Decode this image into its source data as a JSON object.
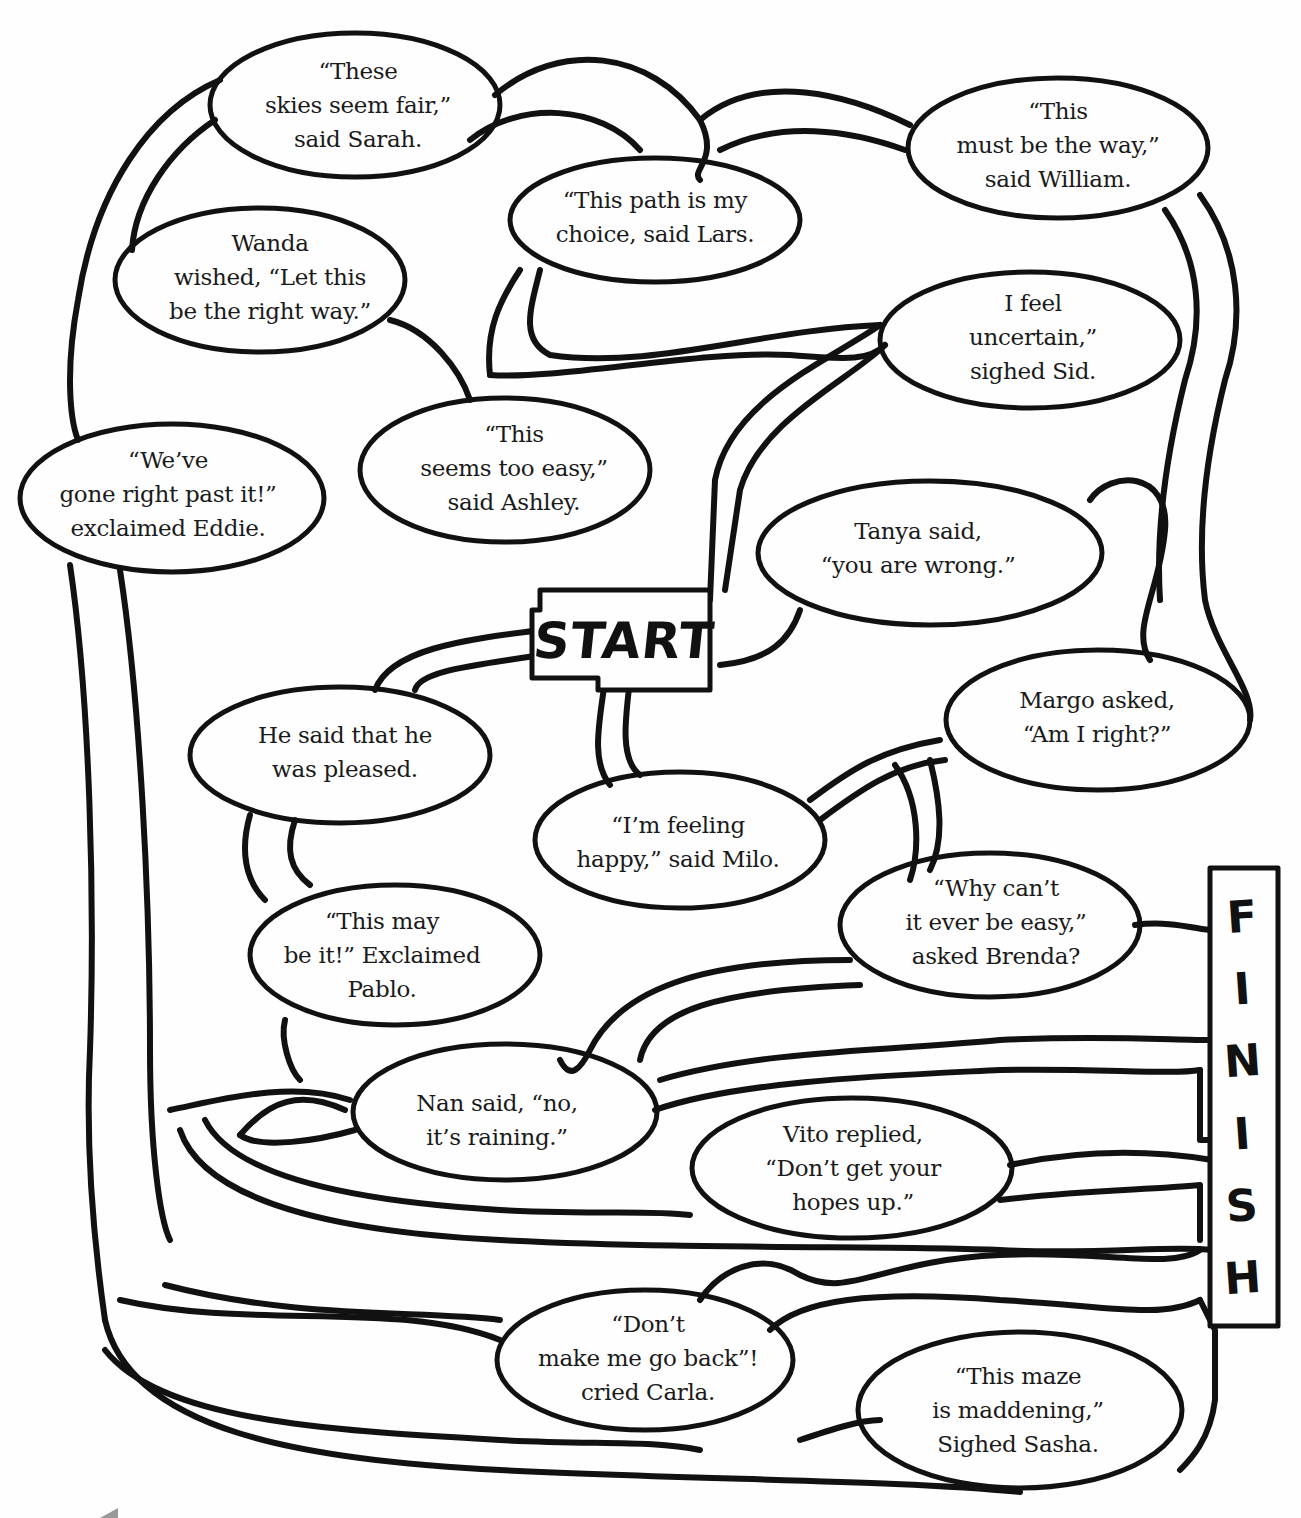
{
  "worksheet": {
    "type": "quotation-maze",
    "start_label": "START",
    "finish_label": "FINISH",
    "finish_letters": [
      "F",
      "I",
      "N",
      "I",
      "S",
      "H"
    ],
    "colors": {
      "ink": "#111111",
      "paper": "#fefefe"
    }
  },
  "bubbles": [
    {
      "id": "sarah",
      "lines": [
        "“These",
        "skies seem fair,”",
        "said Sarah."
      ]
    },
    {
      "id": "william",
      "lines": [
        "“This",
        "must be the way,”",
        "said William."
      ]
    },
    {
      "id": "lars",
      "lines": [
        "“This path is my",
        "choice, said Lars."
      ]
    },
    {
      "id": "wanda",
      "lines": [
        "Wanda",
        "wished, “Let this",
        "be the right way.”"
      ]
    },
    {
      "id": "sid",
      "lines": [
        "I feel",
        "uncertain,”",
        "sighed Sid."
      ]
    },
    {
      "id": "eddie",
      "lines": [
        "“We’ve",
        "gone right past it!”",
        "exclaimed Eddie."
      ]
    },
    {
      "id": "ashley",
      "lines": [
        "“This",
        "seems too easy,”",
        "said Ashley."
      ]
    },
    {
      "id": "tanya",
      "lines": [
        "Tanya said,",
        "“you are wrong.”"
      ]
    },
    {
      "id": "margo",
      "lines": [
        "Margo asked,",
        "“Am I right?”"
      ]
    },
    {
      "id": "he",
      "lines": [
        "He said that he",
        "was pleased."
      ]
    },
    {
      "id": "milo",
      "lines": [
        "“I’m feeling",
        "happy,” said Milo."
      ]
    },
    {
      "id": "brenda",
      "lines": [
        "“Why can’t",
        "it ever be easy,”",
        "asked Brenda?"
      ]
    },
    {
      "id": "pablo",
      "lines": [
        "“This may",
        "be it!” Exclaimed",
        "Pablo."
      ]
    },
    {
      "id": "nan",
      "lines": [
        "Nan said, “no,",
        "it’s raining.”"
      ]
    },
    {
      "id": "vito",
      "lines": [
        "Vito replied,",
        "“Don’t get your",
        "hopes up.”"
      ]
    },
    {
      "id": "carla",
      "lines": [
        "“Don’t",
        "make me go back”!",
        "cried Carla."
      ]
    },
    {
      "id": "sasha",
      "lines": [
        "“This maze",
        "is maddening,”",
        "Sighed Sasha."
      ]
    }
  ]
}
